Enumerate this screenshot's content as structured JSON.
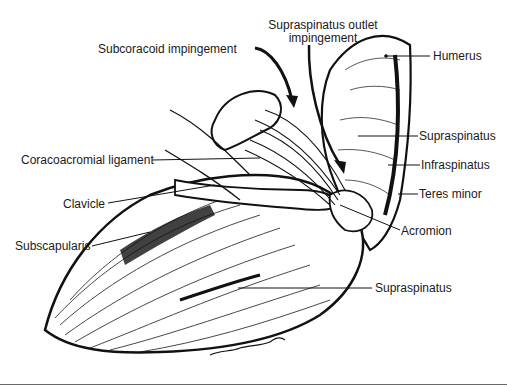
{
  "figure": {
    "type": "anatomical-illustration",
    "signature": "Wm. Loechel"
  },
  "labels": {
    "subcoracoid": "Subcoracoid impingement",
    "supraspinatus_outlet_line1": "Supraspinatus outlet",
    "supraspinatus_outlet_line2": "impingement",
    "humerus": "Humerus",
    "supraspinatus_upper": "Supraspinatus",
    "infraspinatus": "Infraspinatus",
    "teres_minor": "Teres minor",
    "coracoacromial": "Coracoacromial ligament",
    "clavicle": "Clavicle",
    "acromion": "Acromion",
    "subscapularis": "Subscapularis",
    "supraspinatus_lower": "Supraspinatus"
  },
  "colors": {
    "ink": "#111111",
    "background": "#ffffff",
    "rule": "#6a6a6a"
  }
}
